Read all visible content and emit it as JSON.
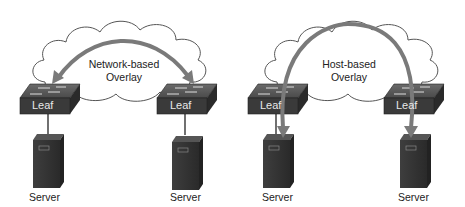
{
  "panels": [
    {
      "overlay_label_line1": "Network-based",
      "overlay_label_line2": "Overlay",
      "leaf_left": "Leaf",
      "leaf_right": "Leaf",
      "server_left": "Server",
      "server_right": "Server"
    },
    {
      "overlay_label_line1": "Host-based",
      "overlay_label_line2": "Overlay",
      "leaf_left": "Leaf",
      "leaf_right": "Leaf",
      "server_left": "Server",
      "server_right": "Server"
    }
  ],
  "colors": {
    "cloud_stroke": "#555555",
    "switch": "#3a3a3a",
    "server": "#333333",
    "arrow": "#7a7a7a"
  }
}
